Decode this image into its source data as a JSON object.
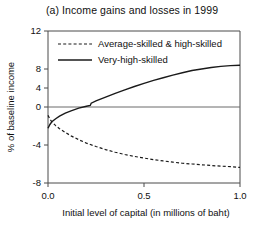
{
  "chart_data": {
    "type": "line",
    "title": "(a) Income gains and losses in 1999",
    "xlabel": "Initial level of capital (in millions of baht)",
    "ylabel": "% of baseline income",
    "xlim": [
      0.0,
      1.0
    ],
    "ylim": [
      -8,
      12
    ],
    "xticks": [
      "0.0",
      "0.5",
      "1.0"
    ],
    "xtick_values": [
      0.0,
      0.5,
      1.0
    ],
    "yticks": [
      "12",
      "8",
      "4",
      "0",
      "-4",
      "-8"
    ],
    "ytick_values": [
      12,
      8,
      4,
      0,
      -4,
      -8
    ],
    "grid": false,
    "legend_position": "top-left inside",
    "zero_reference_line": 0,
    "series": [
      {
        "name": "Average-skilled & high-skilled",
        "style": "dashed",
        "color": "#1a1a1a",
        "x": [
          0.0,
          0.01,
          0.02,
          0.04,
          0.06,
          0.09,
          0.12,
          0.16,
          0.2,
          0.25,
          0.3,
          0.35,
          0.4,
          0.45,
          0.5,
          0.55,
          0.6,
          0.65,
          0.7,
          0.75,
          0.8,
          0.85,
          0.9,
          0.95,
          1.0
        ],
        "values": [
          0.9,
          0.4,
          0.05,
          -0.45,
          -0.85,
          -1.35,
          -1.8,
          -2.3,
          -2.75,
          -3.2,
          -3.6,
          -3.95,
          -4.25,
          -4.5,
          -4.72,
          -4.92,
          -5.1,
          -5.25,
          -5.4,
          -5.5,
          -5.6,
          -5.7,
          -5.78,
          -5.85,
          -5.95
        ]
      },
      {
        "name": "Very-high-skilled",
        "style": "solid",
        "color": "#1a1a1a",
        "x": [
          0.0,
          0.01,
          0.02,
          0.04,
          0.06,
          0.09,
          0.12,
          0.16,
          0.2,
          0.22,
          0.225,
          0.25,
          0.3,
          0.35,
          0.4,
          0.45,
          0.5,
          0.55,
          0.6,
          0.65,
          0.7,
          0.75,
          0.8,
          0.85,
          0.9,
          0.95,
          1.0
        ],
        "values": [
          -0.8,
          -0.3,
          0.05,
          0.45,
          0.8,
          1.2,
          1.5,
          1.85,
          2.1,
          2.2,
          2.5,
          2.8,
          3.3,
          3.8,
          4.25,
          4.7,
          5.1,
          5.5,
          5.85,
          6.2,
          6.5,
          6.8,
          7.0,
          7.2,
          7.35,
          7.45,
          7.5
        ]
      }
    ]
  }
}
